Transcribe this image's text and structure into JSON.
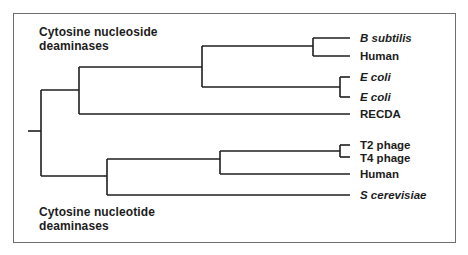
{
  "diagram": {
    "type": "phylogenetic-tree",
    "groups": [
      {
        "label_line1": "Cytosine nucleoside",
        "label_line2": "deaminases"
      },
      {
        "label_line1": "Cytosine nucleotide",
        "label_line2": "deaminases"
      }
    ],
    "leaves": [
      {
        "label": "B subtilis",
        "italic": true,
        "y": 38
      },
      {
        "label": "Human",
        "italic": false,
        "y": 56
      },
      {
        "label": "E coli",
        "italic": true,
        "y": 77
      },
      {
        "label": "E coli",
        "italic": true,
        "y": 97
      },
      {
        "label": "RECDA",
        "italic": false,
        "y": 114
      },
      {
        "label": "T2 phage",
        "italic": false,
        "y": 145
      },
      {
        "label": "T4 phage",
        "italic": false,
        "y": 157
      },
      {
        "label": "Human",
        "italic": false,
        "y": 174
      },
      {
        "label": "S cerevisiae",
        "italic": true,
        "y": 195
      }
    ],
    "colors": {
      "line": "#1e1e1e",
      "border": "#6e6e6e",
      "text": "#1c1c1c"
    }
  }
}
